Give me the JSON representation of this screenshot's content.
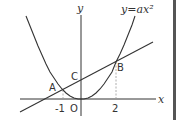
{
  "diagram": {
    "type": "coordinate-graph",
    "equation_label": "y=ax²",
    "axes": {
      "x_label": "x",
      "y_label": "y",
      "origin_label": "O"
    },
    "ticks": {
      "x_neg": "-1",
      "x_pos": "2"
    },
    "points": {
      "A": {
        "label": "A",
        "x": -1,
        "y": 0.5
      },
      "B": {
        "label": "B",
        "x": 2,
        "y": 2
      },
      "C": {
        "label": "C",
        "x": 0,
        "y": 1
      }
    },
    "curves": [
      {
        "name": "parabola",
        "formula": "y=ax²"
      },
      {
        "name": "line",
        "through": [
          "A",
          "B",
          "C"
        ]
      }
    ],
    "colors": {
      "stroke": "#333333",
      "dashed": "#999999",
      "edge_bar": "#555555"
    }
  }
}
